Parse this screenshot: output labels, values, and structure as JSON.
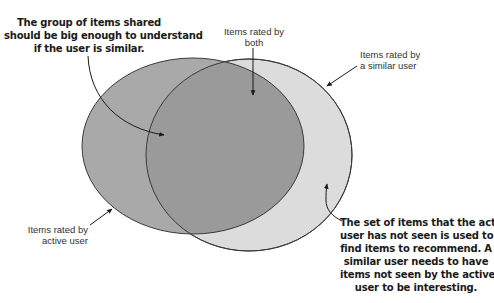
{
  "diagram": {
    "type": "venn",
    "sets": [
      {
        "id": "active",
        "label": [
          "Items rated by",
          "active user"
        ],
        "fill": "#a9a9a9"
      },
      {
        "id": "similar",
        "label": [
          "Items rated by",
          "a similar user"
        ],
        "fill": "#dcdcdc"
      }
    ],
    "intersection": {
      "label": [
        "Items rated by",
        "both"
      ],
      "fill": "#9a9a9a"
    },
    "stroke": "#3a3a3a"
  },
  "callouts": {
    "top_left": [
      "The group of items shared",
      "should be big enough to understand",
      "if the user is similar."
    ],
    "bottom_right": [
      "The set of items that the active",
      "user has not seen is used to",
      "find items to recommend. A",
      "similar user needs to have",
      "items not seen by the active",
      "user to be interesting."
    ]
  },
  "labels": {
    "both": [
      "Items rated by",
      "both"
    ],
    "similar_user": [
      "Items rated by",
      "a similar user"
    ],
    "active_user": [
      "Items rated by",
      "active user"
    ]
  }
}
